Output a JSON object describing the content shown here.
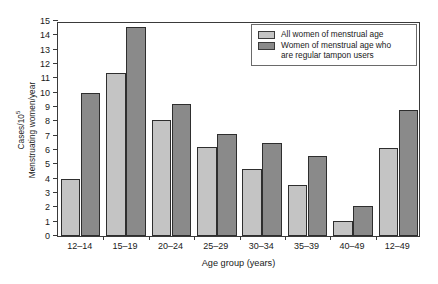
{
  "chart_data": {
    "type": "bar",
    "title": "",
    "subtitle": "",
    "xlabel": "Age group (years)",
    "ylabel_line1": "Cases/10",
    "ylabel_line1_sup": "5",
    "ylabel_line2": "Menstruating women/year",
    "categories": [
      "12–14",
      "15–19",
      "20–24",
      "25–29",
      "30–34",
      "35–39",
      "40–49",
      "12–49"
    ],
    "series": [
      {
        "name": "All women of menstrual age",
        "color": "#c4c4c4",
        "values": [
          4.0,
          11.4,
          8.1,
          6.2,
          4.7,
          3.55,
          1.05,
          6.15
        ]
      },
      {
        "name": "Women of menstrual age who are regular tampon users",
        "color": "#8a8a8a",
        "values": [
          10.0,
          14.6,
          9.2,
          7.1,
          6.5,
          5.6,
          2.1,
          8.8
        ]
      }
    ],
    "ylim": [
      0,
      15
    ],
    "yticks": [
      0,
      1,
      2,
      3,
      4,
      5,
      6,
      7,
      8,
      9,
      10,
      11,
      12,
      13,
      14,
      15
    ],
    "ytick_labels": [
      "0",
      "1",
      "2",
      "3",
      "4",
      "5",
      "6",
      "7",
      "8",
      "9",
      "10",
      "11",
      "12",
      "13",
      "14",
      "15"
    ],
    "grid": false,
    "legend_position": "top-right",
    "legend_entries": [
      {
        "label_lines": [
          "All women of menstrual age"
        ],
        "color": "#c4c4c4"
      },
      {
        "label_lines": [
          "Women of menstrual age who",
          "are regular tampon users"
        ],
        "color": "#8a8a8a"
      }
    ]
  }
}
